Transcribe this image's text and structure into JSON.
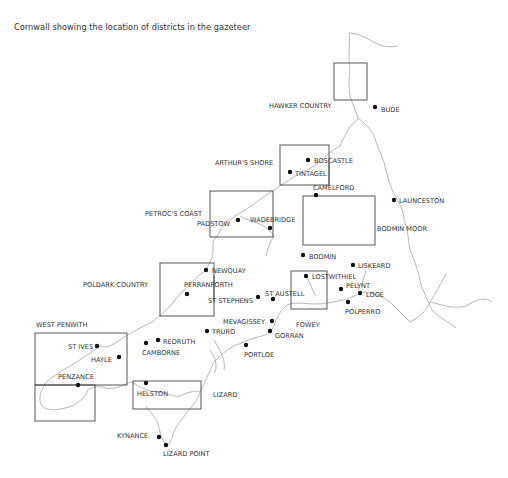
{
  "title": "Cornwall showing the location of districts in the gazeteer",
  "districts": [
    {
      "name": "HAWKER COUNTRY",
      "box": [
        334,
        63,
        33,
        37
      ],
      "label_xy": [
        269,
        105
      ]
    },
    {
      "name": "ARTHUR'S SHORE",
      "box": [
        280,
        145,
        49,
        40
      ],
      "label_xy": [
        215,
        164
      ]
    },
    {
      "name": "PETROC'S COAST",
      "box": [
        210,
        191,
        63,
        46
      ],
      "label_xy": [
        145,
        214
      ]
    },
    {
      "name": "BODMIN MOOR",
      "box": [
        303,
        196,
        72,
        49
      ],
      "label_xy": [
        376,
        230
      ]
    },
    {
      "name": "POLDARK COUNTRY",
      "box": [
        160,
        263,
        54,
        53
      ],
      "label_xy": [
        83,
        285
      ]
    },
    {
      "name": "FOWEY",
      "box": [
        291,
        271,
        36,
        38
      ],
      "label_xy": [
        296,
        326
      ]
    },
    {
      "name": "WEST PENWITH",
      "box": [
        35,
        333,
        92,
        52
      ],
      "label_xy": [
        36,
        327
      ]
    },
    {
      "name": "WEST PENWITH (lower)",
      "box": [
        35,
        385,
        60,
        36
      ],
      "label_xy": null
    },
    {
      "name": "LIZARD",
      "box": [
        133,
        381,
        68,
        28
      ],
      "label_xy": [
        213,
        397
      ]
    }
  ],
  "places": [
    {
      "name": "BUDE",
      "dot": [
        375,
        107
      ],
      "label_xy": [
        381,
        111
      ]
    },
    {
      "name": "BOSCASTLE",
      "dot": [
        308,
        160
      ],
      "label_xy": [
        314,
        163
      ]
    },
    {
      "name": "TINTAGEL",
      "dot": [
        290,
        172
      ],
      "label_xy": [
        295,
        176
      ]
    },
    {
      "name": "CAMELFORD",
      "dot": [
        316,
        195
      ],
      "label_xy": [
        313,
        190
      ]
    },
    {
      "name": "LAUNCESTON",
      "dot": [
        394,
        200
      ],
      "label_xy": [
        399,
        203
      ]
    },
    {
      "name": "PADSTOW",
      "dot": [
        238,
        220
      ],
      "label_xy": [
        197,
        226
      ]
    },
    {
      "name": "WADEBRIDGE",
      "dot": [
        270,
        228
      ],
      "label_xy": [
        250,
        222
      ]
    },
    {
      "name": "BODMIN",
      "dot": [
        303,
        255
      ],
      "label_xy": [
        309,
        259
      ]
    },
    {
      "name": "LISKEARD",
      "dot": [
        353,
        265
      ],
      "label_xy": [
        358,
        268
      ]
    },
    {
      "name": "NEWQUAY",
      "dot": [
        206,
        270
      ],
      "label_xy": [
        212,
        273
      ]
    },
    {
      "name": "LOSTWITHIEL",
      "dot": [
        306,
        276
      ],
      "label_xy": [
        312,
        279
      ]
    },
    {
      "name": "PELYNT",
      "dot": [
        341,
        289
      ],
      "label_xy": [
        346,
        288
      ]
    },
    {
      "name": "PERRANPORTH",
      "dot": [
        187,
        288
      ],
      "label_xy": [
        184,
        287
      ]
    },
    {
      "name": "ST AUSTELL",
      "dot": [
        273,
        299
      ],
      "label_xy": [
        265,
        296
      ]
    },
    {
      "name": "LOOE",
      "dot": [
        360,
        293
      ],
      "label_xy": [
        366,
        297
      ]
    },
    {
      "name": "ST STEPHENS",
      "dot": [
        258,
        297
      ],
      "label_xy": [
        208,
        304
      ]
    },
    {
      "name": "POLPERRO",
      "dot": [
        348,
        302
      ],
      "label_xy": [
        345,
        313
      ]
    },
    {
      "name": "MEVAGISSEY",
      "dot": [
        272,
        321
      ],
      "label_xy": [
        223,
        324
      ]
    },
    {
      "name": "GORRAN",
      "dot": [
        270,
        331
      ],
      "label_xy": [
        275,
        338
      ]
    },
    {
      "name": "TRURO",
      "dot": [
        207,
        331
      ],
      "label_xy": [
        212,
        334
      ]
    },
    {
      "name": "REDRUTH",
      "dot": [
        158,
        340
      ],
      "label_xy": [
        163,
        344
      ]
    },
    {
      "name": "PORTLOE",
      "dot": [
        246,
        345
      ],
      "label_xy": [
        244,
        357
      ]
    },
    {
      "name": "CAMBORNE",
      "dot": [
        146,
        343
      ],
      "label_xy": [
        142,
        355
      ]
    },
    {
      "name": "ST IVES",
      "dot": [
        97,
        346
      ],
      "label_xy": [
        68,
        350
      ]
    },
    {
      "name": "HAYLE",
      "dot": [
        119,
        357
      ],
      "label_xy": [
        91,
        361
      ]
    },
    {
      "name": "PENZANCE",
      "dot": [
        78,
        385
      ],
      "label_xy": [
        58,
        381
      ]
    },
    {
      "name": "HELSTON",
      "dot": [
        146,
        383
      ],
      "label_xy": [
        137,
        397
      ]
    },
    {
      "name": "KYNANCE",
      "dot": [
        159,
        437
      ],
      "label_xy": [
        117,
        438
      ]
    },
    {
      "name": "LIZARD POINT",
      "dot": [
        166,
        445
      ],
      "label_xy": [
        163,
        455
      ]
    }
  ],
  "colors": {
    "coast": "#9a9a9a",
    "box": "#444444",
    "text": "#333333",
    "dot": "#111111"
  }
}
